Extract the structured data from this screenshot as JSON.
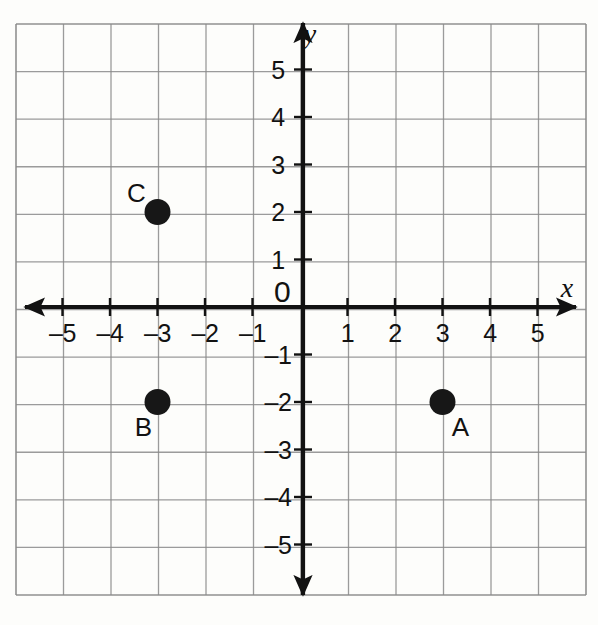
{
  "figure": {
    "kind": "coordinate-plane",
    "background_color": "#fdfdfb",
    "grid_color": "#8a8a8a",
    "axis_color": "#121212",
    "point_color": "#171717"
  },
  "axes": {
    "x_axis_label": "x",
    "y_axis_label": "y",
    "origin_label": "0",
    "x_tick_labels": [
      "–5",
      "–4",
      "–3",
      "–2",
      "–1",
      "1",
      "2",
      "3",
      "4",
      "5"
    ],
    "y_tick_labels": [
      "5",
      "4",
      "3",
      "2",
      "1",
      "–1",
      "–2",
      "–3",
      "–4",
      "–5"
    ]
  },
  "chart_data": {
    "type": "scatter",
    "title": "",
    "subtitle": "",
    "xlabel": "x",
    "ylabel": "y",
    "xlim": [
      -6,
      6
    ],
    "ylim": [
      -6,
      6
    ],
    "xticks": [
      -5,
      -4,
      -3,
      -2,
      -1,
      0,
      1,
      2,
      3,
      4,
      5
    ],
    "yticks": [
      -5,
      -4,
      -3,
      -2,
      -1,
      0,
      1,
      2,
      3,
      4,
      5
    ],
    "xticklabels": [
      "–5",
      "–4",
      "–3",
      "–2",
      "–1",
      "0",
      "1",
      "2",
      "3",
      "4",
      "5"
    ],
    "yticklabels": [
      "–5",
      "–4",
      "–3",
      "–2",
      "–1",
      "0",
      "1",
      "2",
      "3",
      "4",
      "5"
    ],
    "grid": true,
    "grid_spacing": 1,
    "legend": null,
    "axis_style": "double-arrow-centered",
    "points": [
      {
        "label": "A",
        "x": 3,
        "y": -2,
        "label_position": "bottom-right"
      },
      {
        "label": "B",
        "x": -3,
        "y": -2,
        "label_position": "bottom-left"
      },
      {
        "label": "C",
        "x": -3,
        "y": 2,
        "label_position": "top-left"
      }
    ],
    "series": [
      {
        "name": "plotted points",
        "x": [
          3,
          -3,
          -3
        ],
        "y": [
          -2,
          -2,
          2
        ],
        "labels": [
          "A",
          "B",
          "C"
        ],
        "marker": "filled-circle",
        "marker_size": 13,
        "color": "#171717"
      }
    ]
  },
  "geometry": {
    "origin_px": {
      "x": 300,
      "y": 307
    },
    "unit_px": 47.5,
    "grid_bounds_px": {
      "left": 16,
      "top": 24,
      "right": 586,
      "bottom": 595
    },
    "grid_cells": {
      "cols": 12,
      "rows": 12
    }
  }
}
